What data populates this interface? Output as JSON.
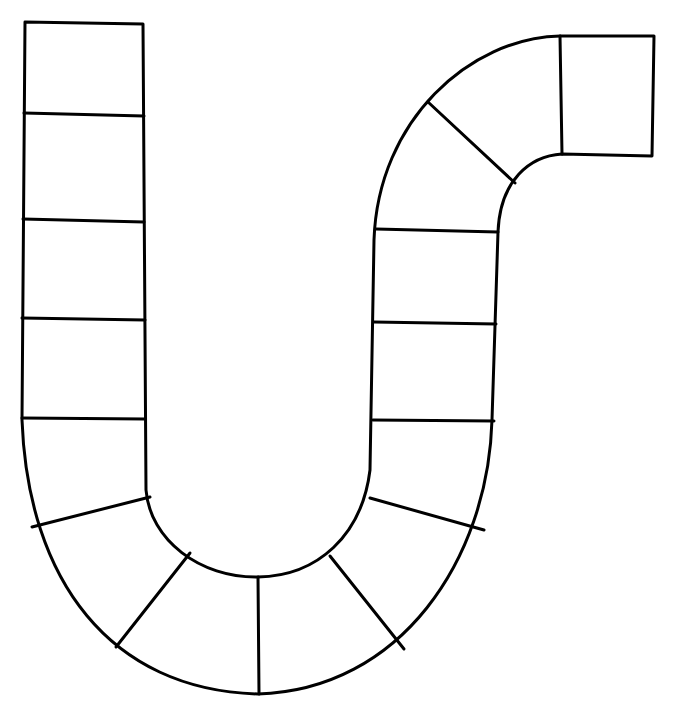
{
  "board": {
    "title": "",
    "description": "Blank game board path",
    "space_count": 19,
    "colors": {
      "background": "#ffffff",
      "stroke": "#000000"
    },
    "spaces": [
      {
        "id": 1,
        "label": ""
      },
      {
        "id": 2,
        "label": ""
      },
      {
        "id": 3,
        "label": ""
      },
      {
        "id": 4,
        "label": ""
      },
      {
        "id": 5,
        "label": ""
      },
      {
        "id": 6,
        "label": ""
      },
      {
        "id": 7,
        "label": ""
      },
      {
        "id": 8,
        "label": ""
      },
      {
        "id": 9,
        "label": ""
      },
      {
        "id": 10,
        "label": ""
      },
      {
        "id": 11,
        "label": ""
      },
      {
        "id": 12,
        "label": ""
      },
      {
        "id": 13,
        "label": ""
      },
      {
        "id": 14,
        "label": ""
      },
      {
        "id": 15,
        "label": ""
      },
      {
        "id": 16,
        "label": ""
      },
      {
        "id": 17,
        "label": ""
      },
      {
        "id": 18,
        "label": ""
      },
      {
        "id": 19,
        "label": ""
      }
    ]
  }
}
